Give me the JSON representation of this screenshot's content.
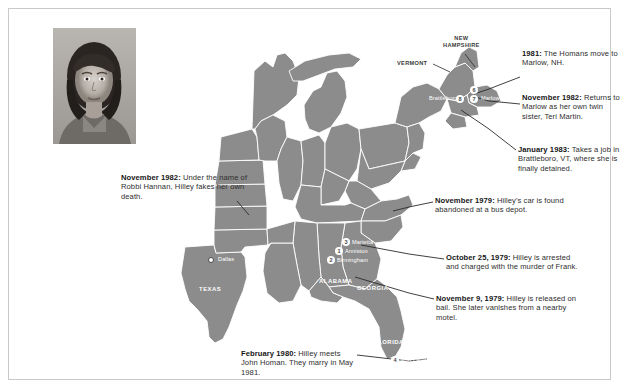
{
  "figure": {
    "kind": "annotated-map",
    "photo_alt": "portrait-photograph-of-woman"
  },
  "colors": {
    "map_fill": "#8c8c8c",
    "map_border_line": "#ffffff",
    "frame_border": "#c9c9c9",
    "text": "#2e2e2e",
    "marker_fill": "#ffffff",
    "marker_text": "#4a4a4a"
  },
  "annotations": [
    {
      "id": "nov-1982-death",
      "date": "November 1982:",
      "text": " Under the name of Robbi Hannan, Hilley fakes her own death."
    },
    {
      "id": "1981-marlow",
      "date": "1981:",
      "text": " The Homans move to Marlow, NH."
    },
    {
      "id": "nov-1982-twin",
      "date": "November 1982:",
      "text": " Returns to Marlow as her own twin sister, Teri Martin."
    },
    {
      "id": "jan-1983-brattleboro",
      "date": "January 1983:",
      "text": " Takes a job in Brattleboro, VT, where she is finally detained."
    },
    {
      "id": "nov-1979-car",
      "date": "November 1979:",
      "text": " Hilley's car is found abandoned at a bus depot."
    },
    {
      "id": "oct-25-1979-arrest",
      "date": "October 25, 1979:",
      "text": " Hilley is arrested and charged with the murder of Frank."
    },
    {
      "id": "nov-9-1979-bail",
      "date": "November 9, 1979:",
      "text": " Hilley is released on bail. She later vanishes from a nearby motel."
    },
    {
      "id": "feb-1980-homan",
      "date": "February 1980:",
      "text": " Hilley meets John Homan. They marry in May 1981."
    }
  ],
  "map": {
    "places": [
      {
        "id": "dallas",
        "label": "Dallas",
        "marker": "5"
      },
      {
        "id": "marietta",
        "label": "Marietta",
        "marker": "3"
      },
      {
        "id": "anniston",
        "label": "Anniston",
        "marker": "1"
      },
      {
        "id": "birmingham",
        "label": "Birmingham",
        "marker": "2"
      },
      {
        "id": "fort-lauderdale",
        "label": "Fort Lauderdale",
        "marker": "4"
      },
      {
        "id": "brattleboro",
        "label": "Brattleboro",
        "marker": "8"
      },
      {
        "id": "marlow",
        "label": "Marlow",
        "marker": "6"
      },
      {
        "id": "marlow-2",
        "label": "",
        "marker": "7"
      }
    ],
    "states": [
      {
        "id": "texas",
        "label": "TEXAS"
      },
      {
        "id": "alabama",
        "label": "ALABAMA"
      },
      {
        "id": "georgia",
        "label": "GEORGIA"
      },
      {
        "id": "florida",
        "label": "FLORIDA"
      },
      {
        "id": "new-hampshire",
        "label": "NEW\nHAMPSHIRE"
      },
      {
        "id": "vermont",
        "label": "VERMONT"
      }
    ],
    "state_labels": {
      "new_hampshire_line1": "NEW",
      "new_hampshire_line2": "HAMPSHIRE",
      "vermont": "VERMONT"
    }
  }
}
